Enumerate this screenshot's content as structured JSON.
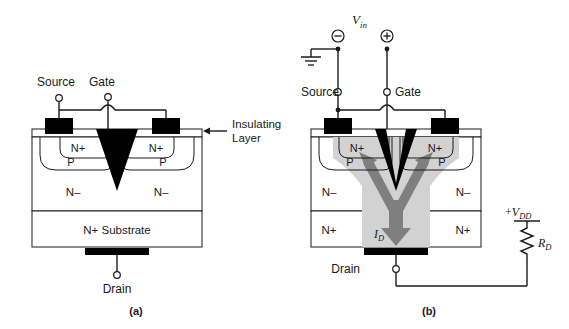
{
  "figure": {
    "title_a": "(a)",
    "title_b": "(b)",
    "colors": {
      "ink": "#1a1a1a",
      "fill_black": "#000000",
      "channel_gray": "#d2d2d2",
      "arrow_gray": "#7f7f7f",
      "background": "#ffffff"
    }
  },
  "panel_a": {
    "caption": "(a)",
    "terminals": {
      "source": "Source",
      "gate": "Gate",
      "drain": "Drain"
    },
    "callout": {
      "line1": "Insulating",
      "line2": "Layer",
      "arrow": "left-arrow-icon"
    },
    "regions": {
      "n_plus_left": "N+",
      "n_plus_right": "N+",
      "p_left": "P",
      "p_right": "P",
      "n_minus_left": "N–",
      "n_minus_right": "N–",
      "substrate": "N+ Substrate"
    }
  },
  "panel_b": {
    "caption": "(b)",
    "terminals": {
      "source": "Source",
      "gate": "Gate",
      "drain": "Drain"
    },
    "source_label": "V",
    "source_sub": "in",
    "minus_sign": "⊖",
    "plus_sign": "⊕",
    "ground": "ground-icon",
    "supply": {
      "label_sign": "+",
      "label_v": "V",
      "label_sub": "DD"
    },
    "resistor": {
      "label_r": "R",
      "label_sub": "D"
    },
    "current": {
      "label_i": "I",
      "label_sub": "D"
    },
    "regions": {
      "n_plus_left": "N+",
      "n_plus_right": "N+",
      "p_left": "P",
      "p_right": "P",
      "n_minus_left": "N–",
      "n_minus_right": "N–",
      "substrate_left": "N+",
      "substrate_right": "N+"
    }
  }
}
